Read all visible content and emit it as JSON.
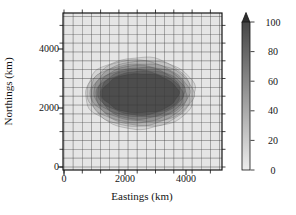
{
  "chart_data": {
    "type": "heatmap",
    "style": "filled-contour-map",
    "title": "",
    "xlabel": "Eastings (km)",
    "ylabel": "Northings (km)",
    "x_ticks": [
      "0",
      "2000",
      "4000"
    ],
    "x_tick_values": [
      0,
      2000,
      4000
    ],
    "y_ticks": [
      "0",
      "2000",
      "4000"
    ],
    "y_tick_values": [
      0,
      2000,
      4000
    ],
    "xlim_km": [
      0,
      5180
    ],
    "ylim_km": [
      0,
      5220
    ],
    "grid": {
      "on": true,
      "step_km": 300,
      "minor_tick_step_km": 600
    },
    "field": {
      "peak_value": 100,
      "background_value": 5,
      "center_km": {
        "x": 2500,
        "y": 2500
      },
      "contour_interval": 10,
      "rings": [
        {
          "level": 10,
          "rx_km": 1800,
          "ry_km": 1210
        },
        {
          "level": 20,
          "rx_km": 1731,
          "ry_km": 1142
        },
        {
          "level": 30,
          "rx_km": 1663,
          "ry_km": 1075
        },
        {
          "level": 40,
          "rx_km": 1594,
          "ry_km": 1008
        },
        {
          "level": 50,
          "rx_km": 1525,
          "ry_km": 940
        },
        {
          "level": 60,
          "rx_km": 1456,
          "ry_km": 872
        },
        {
          "level": 70,
          "rx_km": 1388,
          "ry_km": 805
        },
        {
          "level": 80,
          "rx_km": 1319,
          "ry_km": 738
        },
        {
          "level": 90,
          "rx_km": 1250,
          "ry_km": 670
        }
      ]
    },
    "colorbar": {
      "min": 0,
      "max": 100,
      "ticks": [
        "0",
        "20",
        "40",
        "60",
        "80",
        "100"
      ],
      "tick_values": [
        0,
        20,
        40,
        60,
        80,
        100
      ],
      "arrow_top": true
    },
    "colors": {
      "plot_bg": "#e5e5e5",
      "grid": "#3c3c3c",
      "cmap_low": "#ededed",
      "cmap_high": "#454545",
      "frame": "#141414",
      "arrow": "#2e2e2e",
      "text": "#141414"
    }
  }
}
